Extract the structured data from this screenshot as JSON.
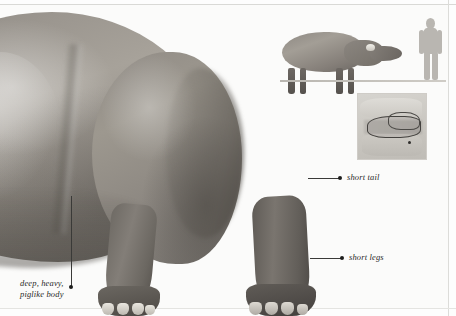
{
  "page": {
    "type": "natural-history-illustration",
    "background_color": "#fbfbfa",
    "frame_color": "#d9d9d6"
  },
  "annotations": [
    {
      "id": "short-tail",
      "text": "short tail",
      "leader": {
        "from_x": 308,
        "from_y": 178,
        "to_x": 340,
        "to_y": 178
      },
      "dot_color": "#1d1d1c"
    },
    {
      "id": "short-legs",
      "text": "short legs",
      "leader": {
        "from_x": 310,
        "from_y": 258,
        "to_x": 342,
        "to_y": 258
      },
      "dot_color": "#1d1d1c"
    },
    {
      "id": "body-build",
      "text": "deep, heavy,\npiglike body",
      "leader": {
        "from_x": 71,
        "from_y": 196,
        "to_x": 71,
        "to_y": 287
      },
      "dot_color": "#1d1d1c"
    }
  ],
  "insets": {
    "scale_comparison": {
      "name": "size comparison",
      "animal_silhouette": "quadruped-mammal-silhouette",
      "human_silhouette": "human-figure-silhouette",
      "ground_line": true,
      "human_color": "#b9b6b1"
    },
    "distribution_map": {
      "name": "distribution map",
      "region": "Mediterranean and southern Europe",
      "range_outline_color": "#44423f",
      "land_color": "#d6d4cf",
      "sea_color": "#b3b0ab"
    }
  },
  "artwork": {
    "main_animal": {
      "name": "piglike prehistoric mammal",
      "hide_color_light": "#a7a29a",
      "hide_color_mid": "#8e8a84",
      "hide_color_dark": "#5a5651",
      "nail_color": "#e9e6df"
    }
  }
}
